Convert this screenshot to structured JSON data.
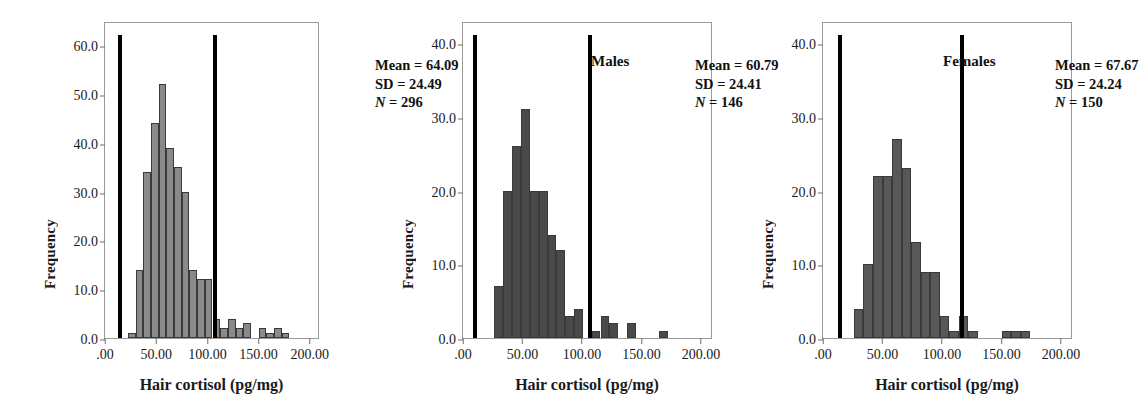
{
  "figure": {
    "caption": "",
    "xlabel": "Hair cortisol (pg/mg)",
    "ylabel": "Frequency",
    "bar_color_total": "#8a8a8a",
    "bar_color_males": "#4a4a4a",
    "bar_color_females": "#585858",
    "reference_line_color": "#000000"
  },
  "chart_data": [
    {
      "type": "bar",
      "title": "",
      "panel": "total",
      "xlabel": "Hair cortisol (pg/mg)",
      "ylabel": "Frequency",
      "xlim": [
        0,
        210
      ],
      "ylim": [
        0,
        65
      ],
      "xticks": [
        ".00",
        "50.00",
        "100.00",
        "150.00",
        "200.00"
      ],
      "xtick_values": [
        0,
        50,
        100,
        150,
        200
      ],
      "yticks": [
        "0.0",
        "10.0",
        "20.0",
        "30.0",
        "40.0",
        "50.0",
        "60.0"
      ],
      "ytick_values": [
        0,
        10,
        20,
        30,
        40,
        50,
        60
      ],
      "grid": false,
      "legend": "none",
      "bin_width": 7.5,
      "bin_starts": [
        22.5,
        30,
        37.5,
        45,
        52.5,
        60,
        67.5,
        75,
        82.5,
        90,
        97.5,
        105,
        112.5,
        120,
        127.5,
        135,
        142.5,
        150,
        157.5,
        165,
        172.5
      ],
      "values": [
        1,
        14,
        34,
        44,
        52,
        39,
        35,
        30,
        14,
        12,
        12,
        4,
        2,
        4,
        2,
        3,
        0,
        2,
        1,
        2,
        1
      ],
      "reference_lines": [
        15.0,
        107.0
      ],
      "annotations": {
        "mean_label": "Mean = 64.09",
        "sd_label": "SD = 24.49",
        "n_prefix": "N",
        "n_label": " = 296"
      }
    },
    {
      "type": "bar",
      "title": "Males",
      "panel": "males",
      "xlabel": "Hair cortisol (pg/mg)",
      "ylabel": "Frequency",
      "xlim": [
        0,
        210
      ],
      "ylim": [
        0,
        43
      ],
      "xticks": [
        ".00",
        "50.00",
        "100.00",
        "150.00",
        "200.00"
      ],
      "xtick_values": [
        0,
        50,
        100,
        150,
        200
      ],
      "yticks": [
        "0.0",
        "10.0",
        "20.0",
        "30.0",
        "40.0"
      ],
      "ytick_values": [
        0,
        10,
        20,
        30,
        40
      ],
      "grid": false,
      "legend": "none",
      "bin_width": 7.5,
      "bin_starts": [
        26,
        33.5,
        41,
        48.5,
        56,
        63.5,
        71,
        78.5,
        86,
        93.5,
        108,
        115.5,
        123,
        138,
        165
      ],
      "values": [
        7,
        20,
        26,
        31,
        20,
        20,
        14,
        12,
        3,
        4,
        1,
        3,
        2,
        2,
        1
      ],
      "reference_lines": [
        10.0,
        107.0
      ],
      "annotations": {
        "mean_label": "Mean = 60.79",
        "sd_label": "SD = 24.41",
        "n_prefix": "N",
        "n_label": " = 146"
      }
    },
    {
      "type": "bar",
      "title": "Females",
      "panel": "females",
      "xlabel": "Hair cortisol (pg/mg)",
      "ylabel": "Frequency",
      "xlim": [
        0,
        210
      ],
      "ylim": [
        0,
        43
      ],
      "xticks": [
        ".00",
        "50.00",
        "100.00",
        "150.00",
        "200.00"
      ],
      "xtick_values": [
        0,
        50,
        100,
        150,
        200
      ],
      "yticks": [
        "0.0",
        "10.0",
        "20.0",
        "30.0",
        "40.0"
      ],
      "ytick_values": [
        0,
        10,
        20,
        30,
        40
      ],
      "grid": false,
      "legend": "none",
      "bin_width": 8.0,
      "bin_starts": [
        26,
        34,
        42,
        50,
        58,
        66,
        74,
        82,
        90,
        98,
        106,
        114,
        122,
        150,
        158,
        166
      ],
      "values": [
        4,
        10,
        22,
        22,
        27,
        23,
        13,
        9,
        9,
        3,
        1,
        3,
        1,
        1,
        1,
        1
      ],
      "reference_lines": [
        14.0,
        117.0
      ],
      "annotations": {
        "mean_label": "Mean = 67.67",
        "sd_label": "SD = 24.24",
        "n_prefix": "N",
        "n_label": " = 150"
      }
    }
  ]
}
